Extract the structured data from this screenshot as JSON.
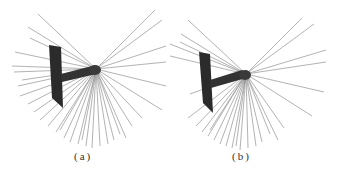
{
  "figure": {
    "panels": [
      {
        "id": "a",
        "caption": "(a)",
        "hub": [
          96,
          69
        ],
        "plate": {
          "top": [
            49,
            45
          ],
          "bottom": [
            63,
            108
          ],
          "width": 12
        }
      },
      {
        "id": "b",
        "caption": "(b)",
        "hub": [
          246,
          74
        ],
        "plate": {
          "top": [
            199,
            52
          ],
          "bottom": [
            213,
            113
          ],
          "width": 12
        }
      }
    ],
    "colors": {
      "lines": "#555555",
      "plate": "#2b2b2b",
      "hub": "#333333",
      "background": "#ffffff"
    }
  }
}
